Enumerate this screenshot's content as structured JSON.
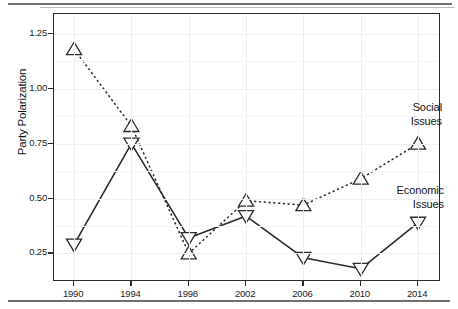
{
  "figure": {
    "ylabel": "Party Polarization",
    "annotations": {
      "social": {
        "line1": "Social",
        "line2": "Issues"
      },
      "economic": {
        "line1": "Economic",
        "line2": "Issues"
      }
    }
  },
  "chart_data": {
    "type": "line",
    "title": "",
    "xlabel": "",
    "ylabel": "Party Polarization",
    "x": [
      1990,
      1994,
      1998,
      2002,
      2006,
      2010,
      2014
    ],
    "categories": [
      "1990",
      "1994",
      "1998",
      "2002",
      "2006",
      "2010",
      "2014"
    ],
    "xtick_labels": [
      "1990",
      "1994",
      "1998",
      "2002",
      "2006",
      "2010",
      "2014"
    ],
    "ytick_labels": [
      "0.25",
      "0.50",
      "0.75",
      "1.00",
      "1.25"
    ],
    "ytick_values": [
      0.25,
      0.5,
      0.75,
      1.0,
      1.25
    ],
    "ylim": [
      0.12,
      1.34
    ],
    "xlim": [
      1988.6,
      2015.6
    ],
    "grid": true,
    "legend_position": "inline-annotations",
    "series": [
      {
        "name": "Social Issues",
        "values": [
          1.18,
          0.83,
          0.25,
          0.49,
          0.47,
          0.59,
          0.75
        ],
        "linestyle": "dotted",
        "marker": "triangle-up",
        "color": "#2b2b2b"
      },
      {
        "name": "Economic Issues",
        "values": [
          0.29,
          0.75,
          0.32,
          0.42,
          0.23,
          0.18,
          0.39
        ],
        "linestyle": "solid",
        "marker": "triangle-down",
        "color": "#2b2b2b"
      }
    ]
  }
}
